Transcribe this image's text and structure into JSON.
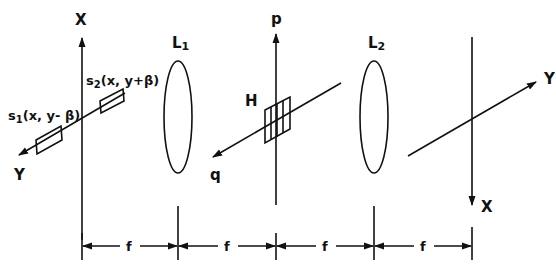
{
  "diagram": {
    "type": "optical-system-schematic",
    "input_plane": {
      "axis_vertical_label": "X",
      "axis_oblique_label": "Y",
      "sources": [
        {
          "label_prefix": "s",
          "label_sub": "1",
          "label_args": "(x, y- β)"
        },
        {
          "label_prefix": "s",
          "label_sub": "2",
          "label_args": "(x, y+β)"
        }
      ]
    },
    "lenses": [
      {
        "label": "L",
        "sub": "1"
      },
      {
        "label": "L",
        "sub": "2"
      }
    ],
    "fourier_plane": {
      "axis_vertical_label": "p",
      "axis_oblique_label": "q",
      "filter_label": "H"
    },
    "output_plane": {
      "axis_vertical_label": "X",
      "axis_oblique_label": "Y"
    },
    "spacing": {
      "segments": [
        "f",
        "f",
        "f",
        "f"
      ]
    },
    "colors": {
      "ink": "#111111",
      "background": "#ffffff"
    }
  }
}
